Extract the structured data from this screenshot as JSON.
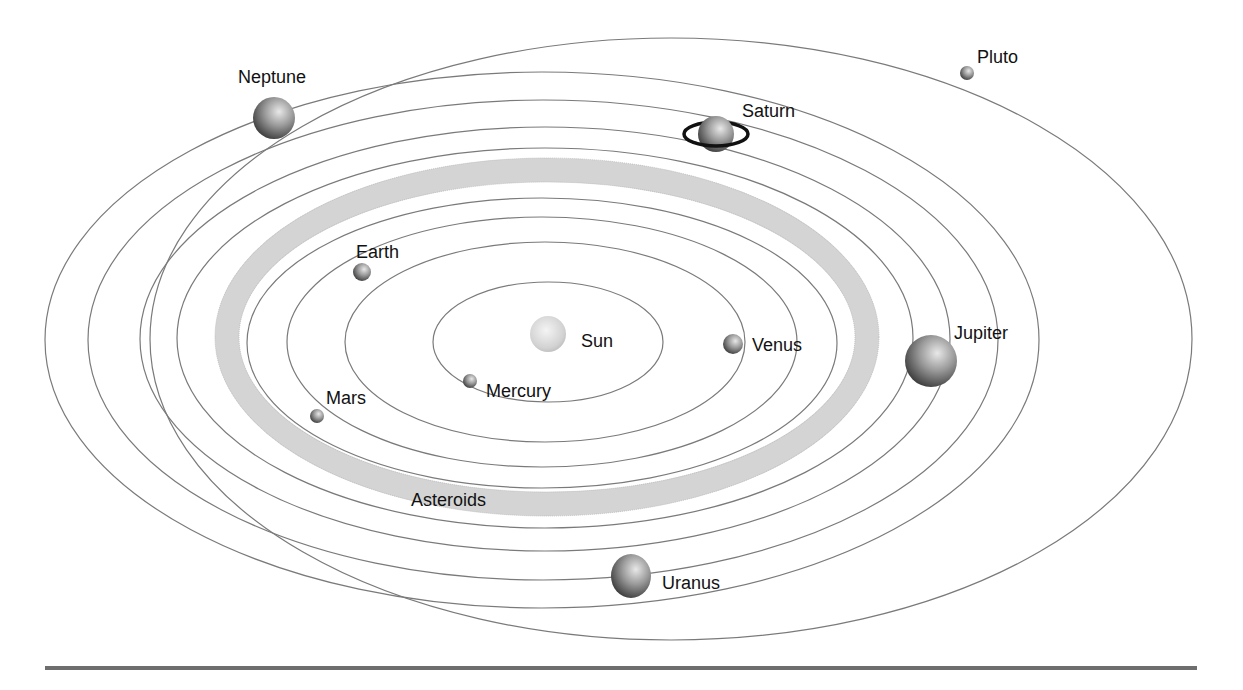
{
  "diagram": {
    "labels": {
      "sun": "Sun",
      "mercury": "Mercury",
      "venus": "Venus",
      "earth": "Earth",
      "mars": "Mars",
      "asteroids": "Asteroids",
      "jupiter": "Jupiter",
      "saturn": "Saturn",
      "uranus": "Uranus",
      "neptune": "Neptune",
      "pluto": "Pluto"
    },
    "bodies": [
      {
        "name": "Sun",
        "x": 548,
        "y": 334,
        "r": 18
      },
      {
        "name": "Mercury",
        "x": 470,
        "y": 381,
        "r": 7
      },
      {
        "name": "Venus",
        "x": 733,
        "y": 344,
        "r": 10
      },
      {
        "name": "Earth",
        "x": 362,
        "y": 272,
        "r": 9
      },
      {
        "name": "Mars",
        "x": 317,
        "y": 416,
        "r": 7
      },
      {
        "name": "Jupiter",
        "x": 931,
        "y": 361,
        "r": 26
      },
      {
        "name": "Saturn",
        "x": 716,
        "y": 134,
        "r": 18
      },
      {
        "name": "Uranus",
        "x": 631,
        "y": 576,
        "r": 21
      },
      {
        "name": "Neptune",
        "x": 274,
        "y": 118,
        "r": 21
      },
      {
        "name": "Pluto",
        "x": 967,
        "y": 73,
        "r": 7
      }
    ],
    "colors": {
      "orbit": "#7a7a7a",
      "asteroid_belt": "#d4d4d4",
      "text": "#111111",
      "rule": "#6e6e6e"
    }
  }
}
